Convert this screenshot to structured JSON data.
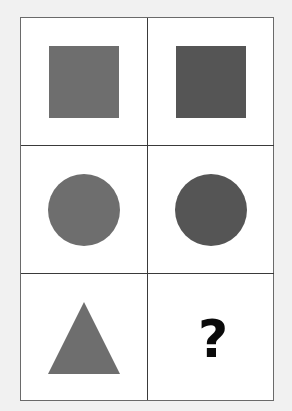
{
  "puzzle": {
    "colors": {
      "light": "#6e6e6e",
      "dark": "#555555",
      "background": "#ffffff",
      "page": "#f1f1f1",
      "grid_line": "#3a3a3a"
    },
    "cells": [
      {
        "row": 0,
        "col": 0,
        "shape": "square",
        "shade": "light"
      },
      {
        "row": 0,
        "col": 1,
        "shape": "square",
        "shade": "dark"
      },
      {
        "row": 1,
        "col": 0,
        "shape": "circle",
        "shade": "light"
      },
      {
        "row": 1,
        "col": 1,
        "shape": "circle",
        "shade": "dark"
      },
      {
        "row": 2,
        "col": 0,
        "shape": "triangle",
        "shade": "light"
      },
      {
        "row": 2,
        "col": 1,
        "shape": "unknown",
        "label": "?"
      }
    ]
  }
}
